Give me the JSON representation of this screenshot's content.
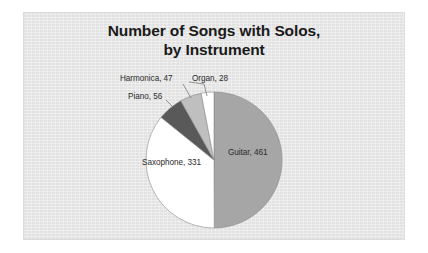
{
  "chart_data": {
    "type": "pie",
    "title": "Number of Songs with Solos, by Instrument",
    "title_lines": [
      "Number of Songs with Solos,",
      "by Instrument"
    ],
    "categories": [
      "Guitar",
      "Saxophone",
      "Piano",
      "Harmonica",
      "Organ"
    ],
    "values": [
      461,
      331,
      56,
      47,
      28
    ],
    "total": 923,
    "labels": [
      "Guitar, 461",
      "Saxophone, 331",
      "Piano, 56",
      "Harmonica, 47",
      "Organ, 28"
    ],
    "slice_colors": [
      "#a6a6a6",
      "#ffffff",
      "#595959",
      "#bfbfbf",
      "#ffffff"
    ],
    "data_labels": true,
    "legend": "none",
    "legend_position": "none",
    "start_angle_deg": 0,
    "direction": "clockwise",
    "xlabel": "",
    "ylabel": "",
    "grid": false
  },
  "slices": [
    {
      "name": "Guitar",
      "label": "Guitar, 461",
      "value": 461,
      "color": "#a6a6a6"
    },
    {
      "name": "Saxophone",
      "label": "Saxophone, 331",
      "value": 331,
      "color": "#ffffff"
    },
    {
      "name": "Piano",
      "label": "Piano, 56",
      "value": 56,
      "color": "#595959"
    },
    {
      "name": "Harmonica",
      "label": "Harmonica, 47",
      "value": 47,
      "color": "#bfbfbf"
    },
    {
      "name": "Organ",
      "label": "Organ, 28",
      "value": 28,
      "color": "#ffffff"
    }
  ],
  "style": {
    "panel_background": "#e8e8e8",
    "page_background": "#ffffff",
    "title_color": "#1a1a1a",
    "label_color": "#2b2b2b",
    "slice_outline": "#8c8c8c"
  }
}
